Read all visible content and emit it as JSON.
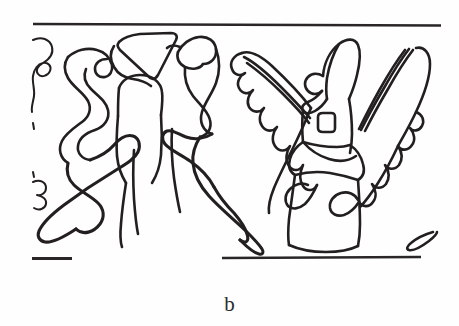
{
  "figure": {
    "caption": "b",
    "panel_label": "b",
    "kind": "line-drawing",
    "ink_color": "#231f20",
    "background_color": "#fefefe",
    "rule_color": "#2a2628"
  },
  "frame": {
    "top_rule": {
      "name": "upper register line",
      "x1": 33,
      "y1": 23,
      "x2": 441,
      "y2": 25
    },
    "bottom_rule_left": {
      "name": "lower register line (left fragment)",
      "x1": 32,
      "y1": 259,
      "x2": 72,
      "y2": 259
    },
    "bottom_rule_right": {
      "name": "lower register line (right segment)",
      "x1": 222,
      "y1": 258,
      "x2": 421,
      "y2": 257
    }
  },
  "elements": {
    "left_figure": {
      "name": "left figure",
      "description": "curvilinear ribbon body with triangular headdress and sweeping lower limb",
      "headdress_shape": "triangle",
      "parts": [
        "triangular headdress",
        "rounded head",
        "scrolled arms",
        "sweeping leg"
      ]
    },
    "center_figure": {
      "name": "center figure",
      "description": "serpent-headed ribbon form facing left",
      "parts": [
        "crested head",
        "neck scroll",
        "curved leg"
      ]
    },
    "right_figure": {
      "name": "right winged figure",
      "description": "winged anthropomorph with pointed cap, beak, square eye and trapezoidal skirt",
      "parts": [
        "pointed cap",
        "beak",
        "square eye",
        "left feathered wing",
        "right feathered wing",
        "trapezoidal skirt"
      ]
    },
    "left_edge_motif": {
      "name": "left edge scallop fragment",
      "description": "partial wavy feather motif cropped by the panel edge"
    },
    "right_edge_motif": {
      "name": "right edge hook fragment",
      "description": "small hooked stroke near the lower right"
    }
  }
}
